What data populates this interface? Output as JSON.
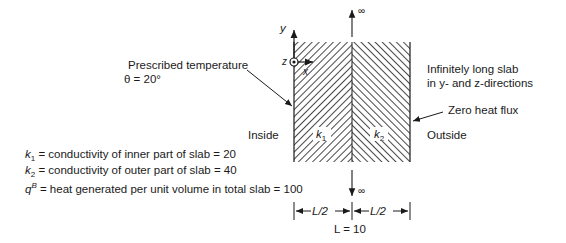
{
  "diagram": {
    "labels": {
      "prescribed_temp_line1": "Prescribed temperature",
      "prescribed_temp_line2": "θ = 20°",
      "infinite_line1": "Infinitely long slab",
      "infinite_line2": "in y- and z-directions",
      "zero_flux": "Zero heat flux",
      "inside": "Inside",
      "outside": "Outside",
      "k1_region": "k1",
      "k2_region": "k2",
      "infinity_top": "∞",
      "infinity_bottom": "∞",
      "axis_y": "y",
      "axis_z": "z",
      "axis_x": "x",
      "half_left": "L/2",
      "half_right": "L/2",
      "total_length": "L = 10"
    },
    "definitions": [
      {
        "symbol": "k1",
        "text": "= conductivity of inner part of slab = 20"
      },
      {
        "symbol": "k2",
        "text": "= conductivity of outer part of slab = 40"
      },
      {
        "symbol": "qB",
        "text": "= heat generated per unit volume in total slab = 100"
      }
    ],
    "colors": {
      "ink": "#1a1a1a",
      "background": "#ffffff"
    }
  }
}
